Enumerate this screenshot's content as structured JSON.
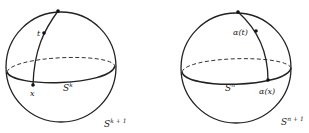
{
  "figure": {
    "left": {
      "point_top_label": "",
      "point_t_label": "t",
      "point_x_label": "x",
      "equator_label": "S",
      "equator_sup": "k",
      "sphere_label": "S",
      "sphere_sup": "k + 1"
    },
    "right": {
      "point_t_label": "α(t)",
      "point_x_label": "α(x)",
      "equator_label": "S",
      "equator_sup": "n",
      "sphere_label": "S",
      "sphere_sup": "n + 1"
    }
  }
}
